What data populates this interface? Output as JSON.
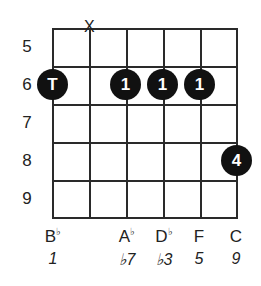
{
  "diagram": {
    "type": "guitar-chord-diagram",
    "fret_numbers": [
      "5",
      "6",
      "7",
      "8",
      "9"
    ],
    "muted_marker": "X",
    "muted_string": 2,
    "dots": [
      {
        "string": 1,
        "fret": "6",
        "label": "T"
      },
      {
        "string": 3,
        "fret": "6",
        "label": "1"
      },
      {
        "string": 4,
        "fret": "6",
        "label": "1"
      },
      {
        "string": 5,
        "fret": "6",
        "label": "1"
      },
      {
        "string": 6,
        "fret": "8",
        "label": "4"
      }
    ],
    "notes": [
      {
        "string": 1,
        "name": "B",
        "accidental": "♭",
        "degree": "1"
      },
      {
        "string": 3,
        "name": "A",
        "accidental": "♭",
        "degree": "♭7"
      },
      {
        "string": 4,
        "name": "D",
        "accidental": "♭",
        "degree": "♭3"
      },
      {
        "string": 5,
        "name": "F",
        "accidental": "",
        "degree": "5"
      },
      {
        "string": 6,
        "name": "C",
        "accidental": "",
        "degree": "9"
      }
    ]
  }
}
